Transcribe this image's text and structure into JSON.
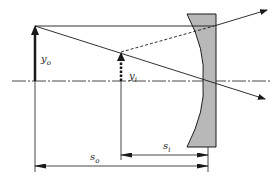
{
  "diagram": {
    "type": "optics-ray-diagram",
    "element": "plano-concave (diverging) lens",
    "colors": {
      "line": "#1a1a1a",
      "lens_fill": "#b8b8b8",
      "background": "#ffffff"
    },
    "labels": {
      "object_height": {
        "base": "y",
        "sub": "o"
      },
      "image_height": {
        "base": "y",
        "sub": "i"
      },
      "object_distance": {
        "base": "s",
        "sub": "o"
      },
      "image_distance": {
        "base": "s",
        "sub": "i"
      }
    },
    "object": {
      "x": 35,
      "base_y": 81,
      "top_y": 26,
      "style": "solid arrow"
    },
    "image": {
      "x": 121,
      "base_y": 81,
      "top_y": 52,
      "style": "dashed arrow (virtual)"
    },
    "optical_axis_y": 81,
    "lens": {
      "left_top_x": 187,
      "right_x": 216,
      "top_y": 14,
      "bottom_y": 147,
      "vertex_x": 202
    },
    "dimension_ref_x": 208
  }
}
